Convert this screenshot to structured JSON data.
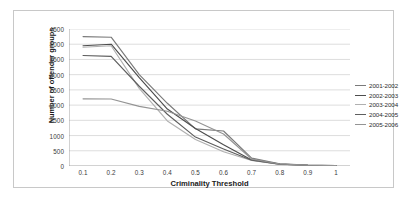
{
  "chart_data": {
    "type": "line",
    "title": "",
    "xlabel": "Criminality Threshold",
    "ylabel": "Number of offender groups",
    "x": [
      0.1,
      0.2,
      0.3,
      0.4,
      0.5,
      0.6,
      0.7,
      0.8,
      0.9,
      1.0
    ],
    "xlim": [
      0.05,
      1.05
    ],
    "ylim": [
      0,
      4500
    ],
    "yticks": [
      0,
      500,
      1000,
      1500,
      2000,
      2500,
      3000,
      3500,
      4000,
      4500
    ],
    "xticks": [
      "0.1",
      "0.2",
      "0.3",
      "0.4",
      "0.5",
      "0.6",
      "0.7",
      "0.8",
      "0.9",
      "1"
    ],
    "grid": "horizontal",
    "legend_position": "right",
    "series": [
      {
        "name": "2001-2002",
        "color": "#7a7a7a",
        "values": [
          4250,
          4230,
          3000,
          2060,
          1220,
          1150,
          260,
          70,
          30,
          15
        ]
      },
      {
        "name": "2002-2003",
        "color": "#4d4d4d",
        "values": [
          3950,
          4000,
          2900,
          1870,
          1230,
          700,
          200,
          60,
          25,
          12
        ]
      },
      {
        "name": "2003-2004",
        "color": "#b0b0b0",
        "values": [
          3900,
          3950,
          2550,
          1480,
          870,
          470,
          180,
          55,
          22,
          10
        ]
      },
      {
        "name": "2004-2005",
        "color": "#5e5e5e",
        "values": [
          3630,
          3600,
          2620,
          1700,
          950,
          560,
          190,
          58,
          24,
          11
        ]
      },
      {
        "name": "2005-2006",
        "color": "#949494",
        "values": [
          2205,
          2200,
          1960,
          1800,
          1480,
          1050,
          230,
          65,
          28,
          13
        ]
      }
    ]
  },
  "legend": {
    "items": [
      {
        "label": "2001-2002"
      },
      {
        "label": "2002-2003"
      },
      {
        "label": "2003-2004"
      },
      {
        "label": "2004-2005"
      },
      {
        "label": "2005-2006"
      }
    ]
  },
  "axes": {
    "y_title": "Number of offender groups",
    "x_title": "Criminality Threshold"
  },
  "colors": {
    "frame_border": "#c8c8c8",
    "gridline": "#cfcfcf",
    "axis_line": "#9a9a9a",
    "tick_text": "#3a3a3a",
    "title_text": "#1a1a1a",
    "background": "#ffffff"
  }
}
